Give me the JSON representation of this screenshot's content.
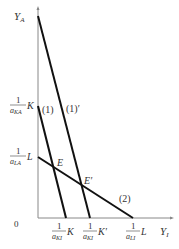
{
  "diagram": {
    "type": "production-possibility / factor-constraint diagram",
    "y_axis_label": "Y",
    "y_axis_sub": "A",
    "x_axis_label": "Y",
    "x_axis_sub": "I",
    "origin_label": "0",
    "y_ticks": [
      {
        "num": "1",
        "den": "a",
        "den_sub": "KA",
        "suffix": "K"
      },
      {
        "num": "1",
        "den": "a",
        "den_sub": "LA",
        "suffix": "L"
      }
    ],
    "x_ticks": [
      {
        "num": "1",
        "den": "a",
        "den_sub": "KI",
        "suffix": "K"
      },
      {
        "num": "1",
        "den": "a",
        "den_sub": "KI",
        "suffix": "K′"
      },
      {
        "num": "1",
        "den": "a",
        "den_sub": "LI",
        "suffix": "L"
      }
    ],
    "lines": [
      {
        "label": "(1)",
        "from": "1/aKA·K",
        "to": "1/aKI·K"
      },
      {
        "label": "(1)′",
        "from": "Y_A top",
        "to": "1/aKI·K′"
      },
      {
        "label": "(2)",
        "from": "1/aLA·L",
        "to": "1/aLI·L"
      }
    ],
    "points": [
      {
        "label": "E"
      },
      {
        "label": "E′"
      }
    ]
  }
}
